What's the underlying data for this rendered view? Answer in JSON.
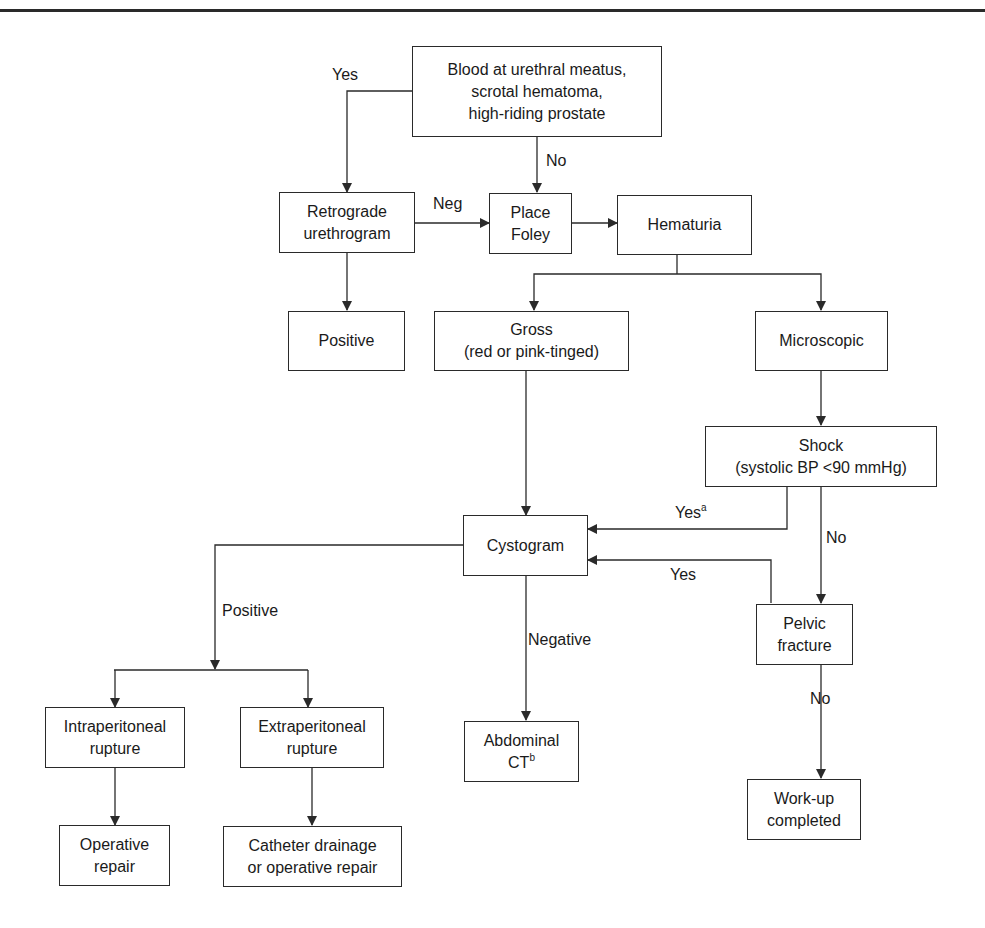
{
  "figure": {
    "type": "flowchart",
    "topic": "Evaluation of lower urinary tract trauma"
  },
  "nodes": {
    "blood_meatus": {
      "text": "Blood at urethral meatus,\nscrotal hematoma,\nhigh-riding prostate"
    },
    "retrograde": {
      "text": "Retrograde\nurethrogram"
    },
    "foley": {
      "text": "Place\nFoley"
    },
    "hematuria": {
      "text": "Hematuria"
    },
    "positive_rug": {
      "text": "Positive"
    },
    "gross": {
      "text": "Gross\n(red or pink-tinged)"
    },
    "microscopic": {
      "text": "Microscopic"
    },
    "shock": {
      "text": "Shock\n(systolic BP <90 mmHg)"
    },
    "cystogram": {
      "text": "Cystogram"
    },
    "pelvic": {
      "text": "Pelvic\nfracture"
    },
    "intraperitoneal": {
      "text": "Intraperitoneal\nrupture"
    },
    "extraperitoneal": {
      "text": "Extraperitoneal\nrupture"
    },
    "abdominal_ct": {
      "text": "Abdominal\nCT",
      "sup": "b"
    },
    "workup": {
      "text": "Work-up\ncompleted"
    },
    "operative": {
      "text": "Operative\nrepair"
    },
    "catheter": {
      "text": "Catheter drainage\nor operative repair"
    }
  },
  "edge_labels": {
    "yes_top": "Yes",
    "no_top": "No",
    "neg": "Neg",
    "yes_shock": "Yes",
    "yes_shock_sup": "a",
    "no_shock": "No",
    "yes_pelvic": "Yes",
    "positive": "Positive",
    "negative": "Negative",
    "no_pelvic": "No"
  },
  "edges": [
    {
      "from": "blood_meatus",
      "to": "retrograde",
      "label": "Yes"
    },
    {
      "from": "blood_meatus",
      "to": "foley",
      "label": "No"
    },
    {
      "from": "retrograde",
      "to": "foley",
      "label": "Neg"
    },
    {
      "from": "retrograde",
      "to": "positive_rug",
      "label": ""
    },
    {
      "from": "foley",
      "to": "hematuria",
      "label": ""
    },
    {
      "from": "hematuria",
      "to": "gross",
      "label": ""
    },
    {
      "from": "hematuria",
      "to": "microscopic",
      "label": ""
    },
    {
      "from": "gross",
      "to": "cystogram",
      "label": ""
    },
    {
      "from": "microscopic",
      "to": "shock",
      "label": ""
    },
    {
      "from": "shock",
      "to": "cystogram",
      "label": "Yes (a)"
    },
    {
      "from": "shock",
      "to": "pelvic",
      "label": "No"
    },
    {
      "from": "pelvic",
      "to": "cystogram",
      "label": "Yes"
    },
    {
      "from": "pelvic",
      "to": "workup",
      "label": "No"
    },
    {
      "from": "cystogram",
      "to": "intraperitoneal",
      "label": "Positive"
    },
    {
      "from": "cystogram",
      "to": "extraperitoneal",
      "label": "Positive"
    },
    {
      "from": "cystogram",
      "to": "abdominal_ct",
      "label": "Negative"
    },
    {
      "from": "intraperitoneal",
      "to": "operative",
      "label": ""
    },
    {
      "from": "extraperitoneal",
      "to": "catheter",
      "label": ""
    }
  ],
  "colors": {
    "line": "#2a2a2a",
    "background": "#ffffff"
  }
}
